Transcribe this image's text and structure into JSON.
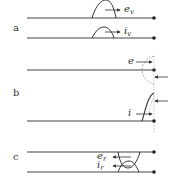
{
  "panels": [
    {
      "id": "a",
      "label": "a",
      "waves": [
        {
          "symbol": "e",
          "subscript": "v",
          "direction": "right"
        },
        {
          "symbol": "i",
          "subscript": "v",
          "direction": "right"
        }
      ]
    },
    {
      "id": "b",
      "label": "b",
      "waves": [
        {
          "symbol": "e",
          "subscript": "",
          "direction": "right"
        },
        {
          "symbol": "i",
          "subscript": "",
          "direction": "right"
        }
      ]
    },
    {
      "id": "c",
      "label": "c",
      "waves": [
        {
          "symbol": "e",
          "subscript": "r",
          "direction": "left"
        },
        {
          "symbol": "i",
          "subscript": "r",
          "direction": "left"
        }
      ]
    }
  ],
  "colors": {
    "line": "#444444",
    "dashed": "#888888"
  }
}
